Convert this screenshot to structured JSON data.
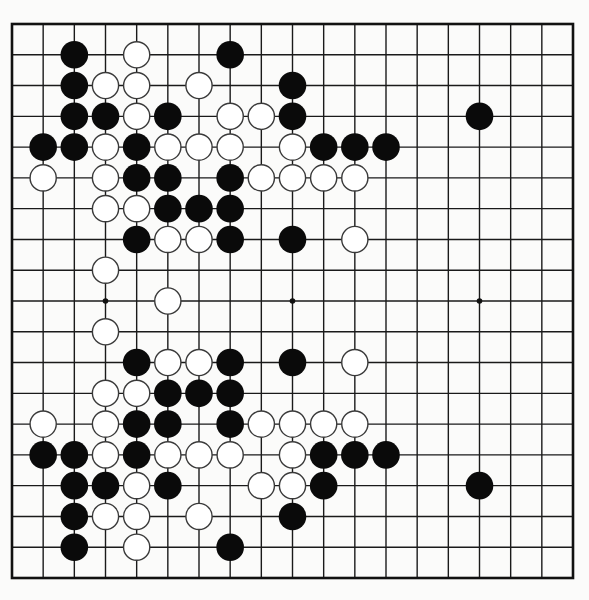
{
  "game": {
    "type": "go-diagram",
    "board_size": 19,
    "colors": {
      "black_stone": "#0a0a0a",
      "white_stone": "#ffffff",
      "white_stone_outline": "#3a3a3a",
      "grid_line": "#1a1a1a",
      "board_background": "#fbfbfa"
    },
    "star_points": [
      [
        3,
        9
      ],
      [
        9,
        9
      ],
      [
        15,
        9
      ]
    ],
    "stones": {
      "black": [
        [
          2,
          1
        ],
        [
          7,
          1
        ],
        [
          2,
          2
        ],
        [
          9,
          2
        ],
        [
          2,
          3
        ],
        [
          3,
          3
        ],
        [
          5,
          3
        ],
        [
          9,
          3
        ],
        [
          15,
          3
        ],
        [
          1,
          4
        ],
        [
          2,
          4
        ],
        [
          4,
          4
        ],
        [
          10,
          4
        ],
        [
          11,
          4
        ],
        [
          12,
          4
        ],
        [
          4,
          5
        ],
        [
          5,
          5
        ],
        [
          7,
          5
        ],
        [
          5,
          6
        ],
        [
          6,
          6
        ],
        [
          7,
          6
        ],
        [
          4,
          7
        ],
        [
          7,
          7
        ],
        [
          9,
          7
        ],
        [
          4,
          11
        ],
        [
          7,
          11
        ],
        [
          9,
          11
        ],
        [
          5,
          12
        ],
        [
          6,
          12
        ],
        [
          7,
          12
        ],
        [
          4,
          13
        ],
        [
          5,
          13
        ],
        [
          7,
          13
        ],
        [
          1,
          14
        ],
        [
          2,
          14
        ],
        [
          4,
          14
        ],
        [
          10,
          14
        ],
        [
          11,
          14
        ],
        [
          12,
          14
        ],
        [
          2,
          15
        ],
        [
          3,
          15
        ],
        [
          5,
          15
        ],
        [
          10,
          15
        ],
        [
          15,
          15
        ],
        [
          2,
          16
        ],
        [
          9,
          16
        ],
        [
          2,
          17
        ],
        [
          7,
          17
        ]
      ],
      "white": [
        [
          4,
          1
        ],
        [
          3,
          2
        ],
        [
          4,
          2
        ],
        [
          6,
          2
        ],
        [
          4,
          3
        ],
        [
          7,
          3
        ],
        [
          8,
          3
        ],
        [
          3,
          4
        ],
        [
          5,
          4
        ],
        [
          6,
          4
        ],
        [
          7,
          4
        ],
        [
          9,
          4
        ],
        [
          1,
          5
        ],
        [
          3,
          5
        ],
        [
          8,
          5
        ],
        [
          9,
          5
        ],
        [
          10,
          5
        ],
        [
          11,
          5
        ],
        [
          3,
          6
        ],
        [
          4,
          6
        ],
        [
          5,
          7
        ],
        [
          6,
          7
        ],
        [
          11,
          7
        ],
        [
          3,
          8
        ],
        [
          5,
          9
        ],
        [
          3,
          10
        ],
        [
          5,
          11
        ],
        [
          6,
          11
        ],
        [
          11,
          11
        ],
        [
          3,
          12
        ],
        [
          4,
          12
        ],
        [
          1,
          13
        ],
        [
          3,
          13
        ],
        [
          8,
          13
        ],
        [
          9,
          13
        ],
        [
          10,
          13
        ],
        [
          11,
          13
        ],
        [
          3,
          14
        ],
        [
          5,
          14
        ],
        [
          6,
          14
        ],
        [
          7,
          14
        ],
        [
          9,
          14
        ],
        [
          4,
          15
        ],
        [
          8,
          15
        ],
        [
          9,
          15
        ],
        [
          3,
          16
        ],
        [
          4,
          16
        ],
        [
          6,
          16
        ],
        [
          4,
          17
        ]
      ]
    },
    "counts": {
      "black": 49,
      "white": 49
    }
  }
}
